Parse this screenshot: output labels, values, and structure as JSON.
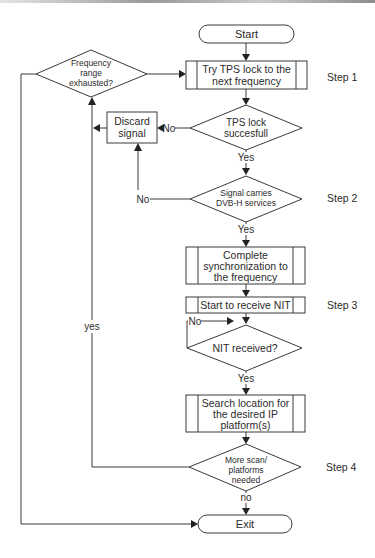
{
  "diagram": {
    "type": "flowchart",
    "nodes": {
      "start": {
        "label": "Start"
      },
      "try_tps": {
        "lines": [
          "Try TPS lock to the",
          "next frequency"
        ]
      },
      "freq_exhausted": {
        "lines": [
          "Frequency",
          "range",
          "exhausted?"
        ]
      },
      "tps_success": {
        "lines": [
          "TPS lock",
          "succesfull"
        ]
      },
      "discard": {
        "lines": [
          "Discard",
          "signal"
        ]
      },
      "dvbh": {
        "lines": [
          "Signal carries",
          "DVB-H services"
        ]
      },
      "complete_sync": {
        "lines": [
          "Complete",
          "synchronization to",
          "the frequency"
        ]
      },
      "start_nit": {
        "label": "Start to receive NIT"
      },
      "nit_received": {
        "label": "NIT received?"
      },
      "search_location": {
        "lines": [
          "Search location for",
          "the desired IP",
          "platform(s)"
        ]
      },
      "more_scan": {
        "lines": [
          "More scan/",
          "platforms",
          "needed"
        ]
      },
      "exit": {
        "label": "Exit"
      }
    },
    "edge_labels": {
      "tps_no": "No",
      "tps_yes": "Yes",
      "dvbh_no": "No",
      "dvbh_yes": "Yes",
      "nit_no": "No",
      "nit_yes": "Yes",
      "more_yes": "yes",
      "more_no": "no"
    },
    "steps": [
      "Step 1",
      "Step 2",
      "Step 3",
      "Step 4"
    ]
  }
}
